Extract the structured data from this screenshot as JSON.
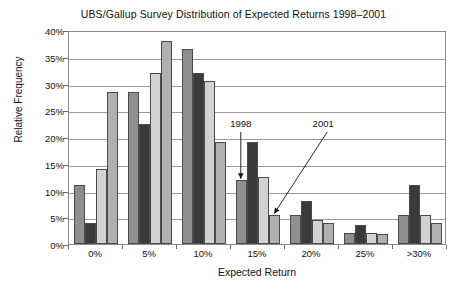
{
  "chart_data": {
    "type": "bar",
    "title": "UBS/Gallup Survey Distribution of Expected Returns 1998–2001",
    "xlabel": "Expected Return",
    "ylabel": "Relative Frequency",
    "categories": [
      "0%",
      "5%",
      "10%",
      "15%",
      "20%",
      "25%",
      ">30%"
    ],
    "ylim": [
      0,
      40
    ],
    "yticks": [
      "0%",
      "5%",
      "10%",
      "15%",
      "20%",
      "25%",
      "30%",
      "35%",
      "40%"
    ],
    "ytick_values": [
      0,
      5,
      10,
      15,
      20,
      25,
      30,
      35,
      40
    ],
    "grid": true,
    "legend": "none",
    "series": [
      {
        "name": "1998",
        "color": "#8f8f8f",
        "values": [
          11,
          28.5,
          36.5,
          12,
          5.5,
          2,
          5.5
        ]
      },
      {
        "name": "1999",
        "color": "#3a3a3a",
        "values": [
          4,
          22.5,
          32,
          19,
          8,
          3.5,
          11
        ]
      },
      {
        "name": "2000",
        "color": "#d2d2d2",
        "values": [
          14,
          32,
          30.5,
          12.5,
          4.5,
          2,
          5.5
        ]
      },
      {
        "name": "2001",
        "color": "#b0b0b0",
        "values": [
          28.5,
          38,
          19,
          5.5,
          4,
          1.8,
          4
        ]
      }
    ],
    "annotations": [
      {
        "label": "1998",
        "points_to_series": "1998",
        "points_to_category": "15%",
        "arrow": "vertical-down"
      },
      {
        "label": "2001",
        "points_to_series": "2001",
        "points_to_category": "15%",
        "arrow": "diagonal-down-left"
      }
    ]
  }
}
